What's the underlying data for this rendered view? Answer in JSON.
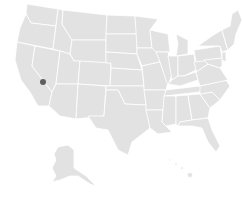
{
  "map": {
    "type": "us-states-choropleth",
    "state_fill": "#e2e2e2",
    "border_color": "#ffffff",
    "background": "#ffffff",
    "markers": [
      {
        "label": "location-marker",
        "approx_region": "Southern California / Nevada border",
        "x": 43,
        "y": 82,
        "color": "#5f5f5f"
      }
    ]
  }
}
